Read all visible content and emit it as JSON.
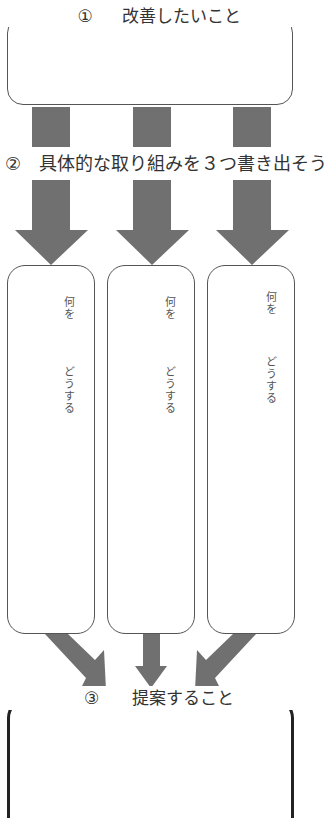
{
  "step1": {
    "number": "①",
    "label": "改善したいこと"
  },
  "step2": {
    "number": "②",
    "label": "具体的な取り組みを３つ書き出そう"
  },
  "step3": {
    "number": "③",
    "label": "提案すること"
  },
  "columns": [
    {
      "what_label": "何を",
      "how_label": "どうする"
    },
    {
      "what_label": "何を",
      "how_label": "どうする"
    },
    {
      "what_label": "何を",
      "how_label": "どうする"
    }
  ],
  "colors": {
    "arrow": "#707070",
    "box_border": "#555555",
    "final_box_border": "#222222",
    "text": "#333333"
  }
}
